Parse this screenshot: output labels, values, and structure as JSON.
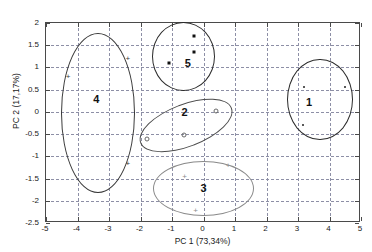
{
  "chart_data": {
    "type": "scatter",
    "title": "",
    "xlabel": "PC 1 (73,34%)",
    "ylabel": "PC 2 (17,17%)",
    "xlim": [
      -5,
      5
    ],
    "ylim": [
      -2.5,
      2
    ],
    "grid": true,
    "legend": "none",
    "xticks": [
      "-5",
      "-4",
      "-3",
      "-2",
      "-1",
      "0",
      "1",
      "2",
      "3",
      "4",
      "5"
    ],
    "xtick_values": [
      -5,
      -4,
      -3,
      -2,
      -1,
      0,
      1,
      2,
      3,
      4,
      5
    ],
    "yticks": [
      "2",
      "1.5",
      "1",
      "0.5",
      "0",
      "-0.5",
      "-1",
      "-1.5",
      "-2",
      "-2.5"
    ],
    "ytick_values": [
      2,
      1.5,
      1,
      0.5,
      0,
      -0.5,
      -1,
      -1.5,
      -2,
      -2.5
    ],
    "clusters": [
      {
        "label": "1",
        "label_x": -0.05,
        "label_y": 0.22,
        "marker": "dot",
        "color": "#2b2b2b",
        "ellipse": {
          "cx": 3.7,
          "cy": 0.28,
          "rx": 1.05,
          "ry": 0.92,
          "rotation": 0
        },
        "points": [
          {
            "x": 3.2,
            "y": 0.55
          },
          {
            "x": 4.5,
            "y": 0.55
          },
          {
            "x": 3.15,
            "y": -0.3
          }
        ]
      },
      {
        "label": "2",
        "label_x": -0.05,
        "label_y": 0.0,
        "marker": "circle",
        "color": "#4d4d4d",
        "ellipse": {
          "cx": -0.55,
          "cy": -0.3,
          "rx": 1.55,
          "ry": 0.48,
          "rotation": -21
        },
        "points": [
          {
            "x": 0.4,
            "y": 0.02
          },
          {
            "x": -0.62,
            "y": -0.53
          },
          {
            "x": -1.78,
            "y": -0.62
          }
        ]
      },
      {
        "label": "3",
        "label_x": 0.0,
        "label_y": 0.0,
        "marker": "plus",
        "color": "#8a8a8a",
        "ellipse": {
          "cx": 0.0,
          "cy": -1.72,
          "rx": 1.6,
          "ry": 0.62,
          "rotation": 0
        },
        "points": [
          {
            "x": 0.78,
            "y": -1.2
          },
          {
            "x": -0.6,
            "y": -1.45
          },
          {
            "x": -0.25,
            "y": -2.2
          }
        ]
      },
      {
        "label": "4",
        "label_x": 0.0,
        "label_y": 0.0,
        "marker": "plus",
        "color": "#3a3a3a",
        "ellipse": {
          "cx": -3.35,
          "cy": -0.02,
          "rx": 1.18,
          "ry": 1.8,
          "rotation": 0
        },
        "points": [
          {
            "x": -4.3,
            "y": 0.8
          },
          {
            "x": -2.4,
            "y": 1.22
          },
          {
            "x": -2.4,
            "y": -1.15
          }
        ]
      },
      {
        "label": "5",
        "label_x": 0.0,
        "label_y": 0.0,
        "marker": "square",
        "color": "#2b2b2b",
        "ellipse": {
          "cx": -0.65,
          "cy": 1.25,
          "rx": 1.0,
          "ry": 0.78,
          "rotation": 0
        },
        "points": [
          {
            "x": -0.3,
            "y": 1.7
          },
          {
            "x": -0.3,
            "y": 1.35
          },
          {
            "x": -1.1,
            "y": 1.1
          }
        ]
      }
    ],
    "cluster_label_positions": [
      {
        "label": "1",
        "x": 3.35,
        "y": 0.22
      },
      {
        "label": "2",
        "x": -0.6,
        "y": 0.0
      },
      {
        "label": "3",
        "x": 0.0,
        "y": -1.72
      },
      {
        "label": "4",
        "x": -3.4,
        "y": 0.28
      },
      {
        "label": "5",
        "x": -0.5,
        "y": 1.1
      }
    ],
    "colors": {
      "axis": "#4a4a4a",
      "grid": "#8d8fa6",
      "text": "#1a1a1a"
    }
  }
}
